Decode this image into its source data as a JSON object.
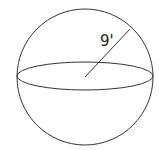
{
  "diagram": {
    "type": "sphere",
    "radius_label": "9'",
    "stroke_color": "#333333",
    "background": "#ffffff"
  }
}
